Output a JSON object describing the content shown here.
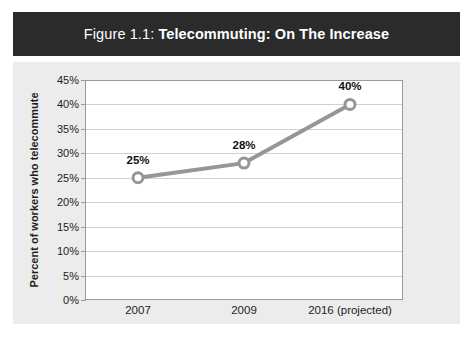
{
  "figure": {
    "title_prefix": "Figure 1.1: ",
    "title_main": "Telecommuting: On The Increase",
    "banner_color": "#2b2b2b",
    "panel_color": "#ececec"
  },
  "chart_data": {
    "type": "line",
    "title": "Figure 1.1: Telecommuting: On The Increase",
    "categories": [
      "2007",
      "2009",
      "2016 (projected)"
    ],
    "values": [
      25,
      28,
      40
    ],
    "point_labels": [
      "25%",
      "28%",
      "40%"
    ],
    "xlabel": "",
    "ylabel": "Percent of workers who telecommute",
    "ylim": [
      0,
      45
    ],
    "ytick_values": [
      0,
      5,
      10,
      15,
      20,
      25,
      30,
      35,
      40,
      45
    ],
    "ytick_labels": [
      "0%",
      "5%",
      "10%",
      "15%",
      "20%",
      "25%",
      "30%",
      "35%",
      "40%",
      "45%"
    ],
    "grid": true,
    "legend": null,
    "series_color": "#969696",
    "marker_fill": "#ffffff",
    "marker_edge": "#969696"
  }
}
